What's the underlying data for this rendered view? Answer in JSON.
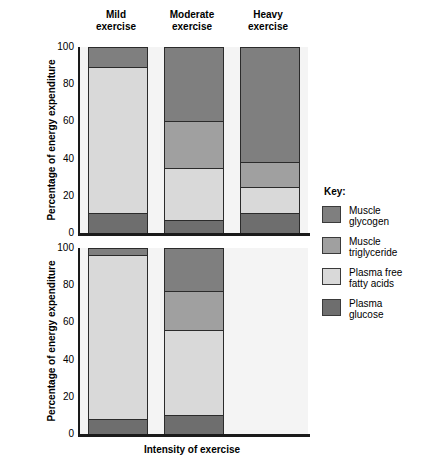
{
  "chart_data": {
    "type": "bar",
    "subtype": "stacked-bar",
    "title": "",
    "xlabel": "Intensity of exercise",
    "categories": [
      "Mild exercise",
      "Moderate exercise",
      "Heavy exercise"
    ],
    "category_lines": [
      [
        "Mild",
        "exercise"
      ],
      [
        "Moderate",
        "exercise"
      ],
      [
        "Heavy",
        "exercise"
      ]
    ],
    "ylim": [
      0,
      100
    ],
    "yticks": [
      0,
      20,
      40,
      60,
      80,
      100
    ],
    "grid": false,
    "legend_position": "right",
    "legend_title": "Key:",
    "series_order": [
      "Plasma glucose",
      "Plasma free fatty acids",
      "Muscle triglyceride",
      "Muscle glycogen"
    ],
    "panels": [
      {
        "id": "top",
        "ylabel_line1": "Percentage of energy expenditure",
        "ylabel_line2": "0–30 min of exercise",
        "series": [
          {
            "name": "Muscle glycogen",
            "color": "#7f7f7f",
            "values": [
              11,
              40,
              62
            ]
          },
          {
            "name": "Muscle triglyceride",
            "color": "#a0a0a0",
            "values": [
              0,
              25,
              13
            ]
          },
          {
            "name": "Plasma free fatty acids",
            "color": "#d9d9d9",
            "values": [
              78,
              28,
              14
            ]
          },
          {
            "name": "Plasma glucose",
            "color": "#6e6e6e",
            "values": [
              11,
              7,
              11
            ]
          }
        ],
        "stack_boundaries": {
          "Mild exercise": [
            0,
            11,
            89,
            89,
            100
          ],
          "Moderate exercise": [
            0,
            7,
            35,
            60,
            100
          ],
          "Heavy exercise": [
            0,
            11,
            25,
            38,
            100
          ]
        }
      },
      {
        "id": "bottom",
        "ylabel_line1": "Percentage of energy expenditure",
        "ylabel_line2": "90–120 min of exercise",
        "series": [
          {
            "name": "Muscle glycogen",
            "color": "#7f7f7f",
            "values": [
              4,
              23,
              0
            ]
          },
          {
            "name": "Muscle triglyceride",
            "color": "#a0a0a0",
            "values": [
              0,
              21,
              0
            ]
          },
          {
            "name": "Plasma free fatty acids",
            "color": "#d9d9d9",
            "values": [
              88,
              46,
              0
            ]
          },
          {
            "name": "Plasma glucose",
            "color": "#6e6e6e",
            "values": [
              8,
              10,
              0
            ]
          }
        ],
        "stack_boundaries": {
          "Mild exercise": [
            0,
            8,
            96,
            96,
            100
          ],
          "Moderate exercise": [
            0,
            10,
            56,
            77,
            100
          ],
          "Heavy exercise": [
            0,
            0,
            0,
            0,
            0
          ]
        }
      }
    ]
  },
  "legend": {
    "title": "Key:",
    "items": [
      {
        "label_lines": [
          "Muscle",
          "glycogen"
        ],
        "color": "#7f7f7f"
      },
      {
        "label_lines": [
          "Muscle",
          "triglyceride"
        ],
        "color": "#a0a0a0"
      },
      {
        "label_lines": [
          "Plasma free",
          "fatty acids"
        ],
        "color": "#d9d9d9"
      },
      {
        "label_lines": [
          "Plasma",
          "glucose"
        ],
        "color": "#6e6e6e"
      }
    ]
  },
  "axes": {
    "ytick_labels": [
      "100",
      "80",
      "60",
      "40",
      "20",
      "0"
    ],
    "xlabel": "Intensity of exercise"
  },
  "colors": {
    "plot_background": "#f4f4f4",
    "axis": "#1a1a1a",
    "page_background": "#ffffff"
  }
}
